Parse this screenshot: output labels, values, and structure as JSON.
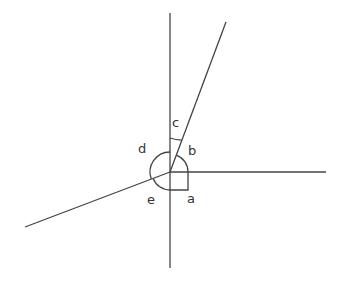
{
  "diagram": {
    "type": "angles-at-a-point",
    "line_color": "#444444",
    "vertex": [
      170,
      172
    ],
    "labels": {
      "a": "a",
      "b": "b",
      "c": "c",
      "d": "d",
      "e": "e"
    }
  }
}
